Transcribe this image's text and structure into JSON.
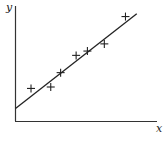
{
  "chart_data": {
    "type": "scatter",
    "title": "",
    "xlabel": "x",
    "ylabel": "y",
    "grid": false,
    "legend": null,
    "axis_ticks": "none",
    "points": [
      {
        "x": 1.1,
        "y": 2.3
      },
      {
        "x": 2.5,
        "y": 2.4
      },
      {
        "x": 3.2,
        "y": 3.4
      },
      {
        "x": 4.3,
        "y": 4.6
      },
      {
        "x": 5.1,
        "y": 4.9
      },
      {
        "x": 6.3,
        "y": 5.4
      },
      {
        "x": 7.8,
        "y": 7.3
      }
    ],
    "fit_line": {
      "type": "linear",
      "x0": 0,
      "y0": 0.9,
      "x1": 8.6,
      "y1": 7.5
    },
    "xlim": [
      0,
      10
    ],
    "ylim": [
      0,
      8
    ],
    "colors": {
      "ink": "#222222",
      "background": "#ffffff"
    }
  },
  "labels": {
    "x_axis": "x",
    "y_axis": "y"
  }
}
